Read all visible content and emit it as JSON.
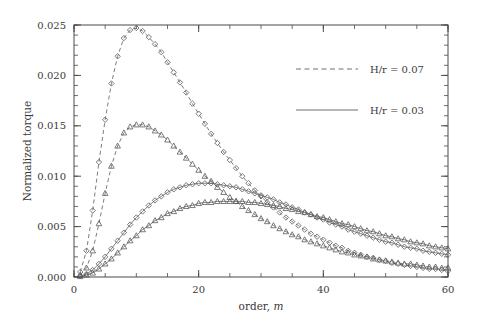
{
  "chart_data": {
    "type": "line",
    "title": "",
    "xlabel": "order, m",
    "xlabel_plain": "order,",
    "xlabel_italic": "m",
    "ylabel": "Normalized torque",
    "xlim": [
      0,
      60
    ],
    "ylim": [
      0.0,
      0.025
    ],
    "xticks": [
      0,
      20,
      40,
      60
    ],
    "xtick_labels": [
      "0",
      "20",
      "40",
      "60"
    ],
    "yticks": [
      0.0,
      0.005,
      0.01,
      0.015,
      0.02,
      0.025
    ],
    "ytick_labels": [
      "0.000",
      "0.005",
      "0.010",
      "0.015",
      "0.020",
      "0.025"
    ],
    "x_minor_step": 5,
    "y_minor_step": 0.001,
    "grid": false,
    "legend_position": "upper right",
    "legend": [
      {
        "label": "H/r = 0.07",
        "linestyle": "dashed",
        "color": "#6e6e6e"
      },
      {
        "label": "H/r = 0.03",
        "linestyle": "solid",
        "color": "#6e6e6e"
      }
    ],
    "marker_colors": {
      "stroke": "#5a5a5a"
    },
    "series": [
      {
        "name": "H/r = 0.07, diamonds",
        "linestyle": "dashed",
        "marker": "diamond",
        "x": [
          1,
          2,
          3,
          4,
          5,
          6,
          7,
          8,
          9,
          10,
          11,
          12,
          13,
          14,
          15,
          16,
          17,
          18,
          19,
          20,
          21,
          22,
          23,
          24,
          25,
          26,
          27,
          28,
          29,
          30,
          31,
          32,
          33,
          34,
          35,
          36,
          37,
          38,
          39,
          40,
          41,
          42,
          43,
          44,
          45,
          46,
          47,
          48,
          49,
          50,
          51,
          52,
          53,
          54,
          55,
          56,
          57,
          58,
          59,
          60
        ],
        "y": [
          0.0005,
          0.0026,
          0.0066,
          0.0114,
          0.0156,
          0.0192,
          0.0219,
          0.0237,
          0.0245,
          0.0247,
          0.0244,
          0.0238,
          0.0231,
          0.0223,
          0.0213,
          0.0203,
          0.0193,
          0.0183,
          0.0172,
          0.0162,
          0.0152,
          0.0142,
          0.0133,
          0.0124,
          0.0116,
          0.0108,
          0.01,
          0.0093,
          0.0086,
          0.008,
          0.0074,
          0.0069,
          0.0064,
          0.0059,
          0.0055,
          0.0051,
          0.0047,
          0.0043,
          0.004,
          0.0037,
          0.0034,
          0.0031,
          0.0029,
          0.0026,
          0.0024,
          0.0022,
          0.002,
          0.0019,
          0.0017,
          0.0016,
          0.0014,
          0.0013,
          0.0012,
          0.0011,
          0.001,
          0.0009,
          0.0008,
          0.0008,
          0.0007,
          0.0006
        ]
      },
      {
        "name": "H/r = 0.07, triangles",
        "linestyle": "dashed",
        "marker": "triangle",
        "x": [
          1,
          2,
          3,
          4,
          5,
          6,
          7,
          8,
          9,
          10,
          11,
          12,
          13,
          14,
          15,
          16,
          17,
          18,
          19,
          20,
          21,
          22,
          23,
          24,
          25,
          26,
          27,
          28,
          29,
          30,
          31,
          32,
          33,
          34,
          35,
          36,
          37,
          38,
          39,
          40,
          41,
          42,
          43,
          44,
          45,
          46,
          47,
          48,
          49,
          50,
          51,
          52,
          53,
          54,
          55,
          56,
          57,
          58,
          59,
          60
        ],
        "y": [
          0.0002,
          0.0009,
          0.0026,
          0.0053,
          0.0083,
          0.011,
          0.013,
          0.0143,
          0.0149,
          0.0151,
          0.0151,
          0.0149,
          0.0145,
          0.0141,
          0.0136,
          0.013,
          0.0124,
          0.0118,
          0.0112,
          0.0106,
          0.01,
          0.0095,
          0.0089,
          0.0084,
          0.0079,
          0.0075,
          0.007,
          0.0066,
          0.0062,
          0.0058,
          0.0055,
          0.0051,
          0.0048,
          0.0045,
          0.0042,
          0.004,
          0.0037,
          0.0035,
          0.0033,
          0.0031,
          0.0029,
          0.0027,
          0.0025,
          0.0024,
          0.0022,
          0.0021,
          0.002,
          0.0018,
          0.0017,
          0.0016,
          0.0015,
          0.0014,
          0.0013,
          0.0013,
          0.0012,
          0.0011,
          0.001,
          0.001,
          0.0009,
          0.0009
        ]
      },
      {
        "name": "H/r = 0.03, diamonds",
        "linestyle": "solid",
        "marker": "diamond",
        "x": [
          1,
          2,
          3,
          4,
          5,
          6,
          7,
          8,
          9,
          10,
          11,
          12,
          13,
          14,
          15,
          16,
          17,
          18,
          19,
          20,
          21,
          22,
          23,
          24,
          25,
          26,
          27,
          28,
          29,
          30,
          31,
          32,
          33,
          34,
          35,
          36,
          37,
          38,
          39,
          40,
          41,
          42,
          43,
          44,
          45,
          46,
          47,
          48,
          49,
          50,
          51,
          52,
          53,
          54,
          55,
          56,
          57,
          58,
          59,
          60
        ],
        "y": [
          0.0001,
          0.0003,
          0.0007,
          0.0013,
          0.002,
          0.0028,
          0.0036,
          0.0044,
          0.0052,
          0.0059,
          0.0065,
          0.0071,
          0.0076,
          0.008,
          0.0084,
          0.0087,
          0.0089,
          0.0091,
          0.0092,
          0.0093,
          0.0093,
          0.0093,
          0.0092,
          0.0091,
          0.009,
          0.0089,
          0.0087,
          0.0085,
          0.0083,
          0.0081,
          0.0079,
          0.0077,
          0.0074,
          0.0072,
          0.0069,
          0.0067,
          0.0064,
          0.0062,
          0.0059,
          0.0057,
          0.0054,
          0.0052,
          0.005,
          0.0047,
          0.0045,
          0.0043,
          0.0041,
          0.0039,
          0.0037,
          0.0035,
          0.0034,
          0.0032,
          0.003,
          0.0029,
          0.0028,
          0.0026,
          0.0025,
          0.0024,
          0.0023,
          0.0022
        ]
      },
      {
        "name": "H/r = 0.03, triangles",
        "linestyle": "solid",
        "marker": "triangle",
        "x": [
          1,
          2,
          3,
          4,
          5,
          6,
          7,
          8,
          9,
          10,
          11,
          12,
          13,
          14,
          15,
          16,
          17,
          18,
          19,
          20,
          21,
          22,
          23,
          24,
          25,
          26,
          27,
          28,
          29,
          30,
          31,
          32,
          33,
          34,
          35,
          36,
          37,
          38,
          39,
          40,
          41,
          42,
          43,
          44,
          45,
          46,
          47,
          48,
          49,
          50,
          51,
          52,
          53,
          54,
          55,
          56,
          57,
          58,
          59,
          60
        ],
        "y": [
          5e-05,
          0.0002,
          0.0004,
          0.0008,
          0.0013,
          0.0018,
          0.0024,
          0.003,
          0.0036,
          0.0041,
          0.0047,
          0.0051,
          0.0056,
          0.0059,
          0.0063,
          0.0065,
          0.0068,
          0.007,
          0.0071,
          0.0073,
          0.0074,
          0.0074,
          0.0075,
          0.0075,
          0.0075,
          0.0075,
          0.0075,
          0.0074,
          0.0074,
          0.0073,
          0.0072,
          0.0071,
          0.007,
          0.0068,
          0.0067,
          0.0065,
          0.0064,
          0.0062,
          0.006,
          0.0059,
          0.0057,
          0.0055,
          0.0053,
          0.0052,
          0.005,
          0.0048,
          0.0046,
          0.0045,
          0.0043,
          0.0041,
          0.004,
          0.0038,
          0.0037,
          0.0035,
          0.0034,
          0.0033,
          0.0031,
          0.003,
          0.0029,
          0.0028
        ]
      }
    ]
  }
}
